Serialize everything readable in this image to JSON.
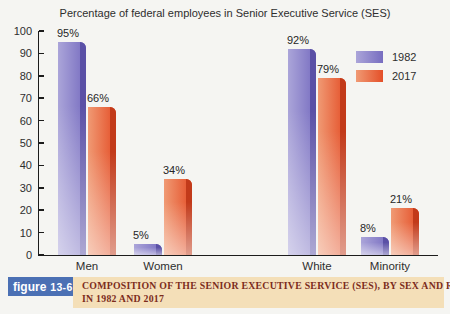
{
  "chart_data": {
    "type": "bar",
    "title": "Percentage of federal employees in Senior Executive Service (SES)",
    "categories": [
      "Men",
      "Women",
      "White",
      "Minority"
    ],
    "series": [
      {
        "name": "1982",
        "values": [
          95,
          5,
          92,
          8
        ],
        "face_light": "#aba5d9",
        "face_dark": "#776dc0",
        "edge": "#5a50a6"
      },
      {
        "name": "2017",
        "values": [
          66,
          34,
          79,
          21
        ],
        "face_light": "#f09a74",
        "face_dark": "#e44f28",
        "edge": "#c23a1a"
      }
    ],
    "value_suffix": "%",
    "ylim": [
      0,
      100
    ],
    "yticks": [
      0,
      10,
      20,
      30,
      40,
      50,
      60,
      70,
      80,
      90,
      100
    ],
    "legend_position": "top-right",
    "grid": false,
    "group_x": [
      19,
      95,
      249,
      322
    ]
  },
  "caption": {
    "tag_word": "figure",
    "tag_number": "13-6",
    "lines": [
      "COMPOSITION OF THE SENIOR EXECUTIVE SERVICE (SES), BY SEX AND RACE",
      "IN 1982 AND 2017"
    ],
    "tag_color": "#4b70b4",
    "band_color": "#f4dfb8",
    "text_color": "#7c2c1c"
  }
}
